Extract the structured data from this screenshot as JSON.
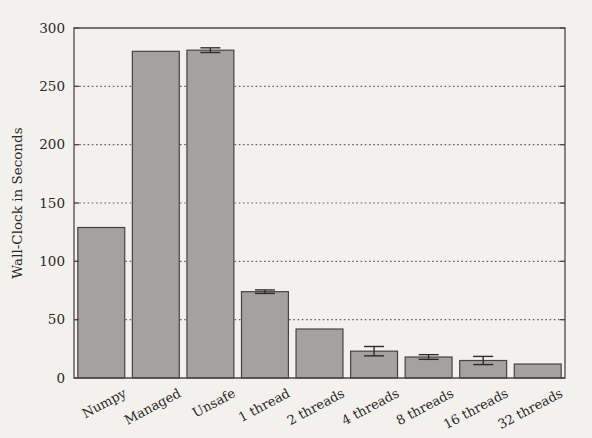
{
  "chart_data": {
    "type": "bar",
    "title": "",
    "xlabel": "",
    "ylabel": "Wall-Clock in Seconds",
    "ylim": [
      0,
      300
    ],
    "ytick_labels": [
      "0",
      "50",
      "100",
      "150",
      "200",
      "250",
      "300"
    ],
    "yticks": [
      0,
      50,
      100,
      150,
      200,
      250,
      300
    ],
    "grid": "horizontal-dotted",
    "legend": "none",
    "categories": [
      "Numpy",
      "Managed",
      "Unsafe",
      "1 thread",
      "2 threads",
      "4 threads",
      "8 threads",
      "16 threads",
      "32 threads"
    ],
    "values": [
      129,
      280,
      281,
      74,
      42,
      23,
      18,
      15,
      12
    ],
    "errors": [
      0,
      0,
      2,
      1.5,
      0,
      4,
      2,
      3.5,
      0
    ],
    "bar_color": "#a3a2a0",
    "bar_edge_color": "#46443f",
    "background_color": "#f3f1ee",
    "axis_color": "#4b4845"
  },
  "figure": {
    "plot_left": 74,
    "plot_right": 565,
    "plot_top": 28,
    "plot_bottom": 378
  }
}
